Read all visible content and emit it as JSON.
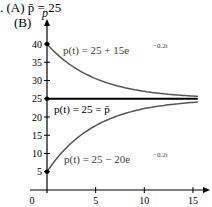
{
  "header": {
    "part_a": ". (A) ",
    "pbar": "p",
    "eq": " = 25",
    "part_b": "(B)"
  },
  "chart_data": {
    "type": "line",
    "title": "",
    "xlabel": "",
    "ylabel": "p",
    "xlim": [
      0,
      16
    ],
    "ylim": [
      0,
      45
    ],
    "x_ticks": [
      0,
      5,
      10,
      15
    ],
    "y_ticks": [
      5,
      10,
      15,
      20,
      25,
      30,
      35,
      40
    ],
    "series": [
      {
        "name": "p(t) = 25 + 15e^{-0.2t}",
        "formula": "25+15*exp(-0.2t)",
        "start": [
          0,
          40
        ]
      },
      {
        "name": "p(t) = 25 = p̄",
        "formula": "25",
        "start": [
          0,
          25
        ]
      },
      {
        "name": "p(t) = 25 − 20e^{-0.2t}",
        "formula": "25-20*exp(-0.2t)",
        "start": [
          0,
          5
        ]
      }
    ]
  },
  "labels": {
    "upper": "p(t) = 25 + 15e",
    "upper_exp": "−0.2t",
    "mid": "p(t) = 25 = p̄",
    "lower": "p(t) = 25 − 20e",
    "lower_exp": "−0.2t",
    "yaxis": "p"
  }
}
